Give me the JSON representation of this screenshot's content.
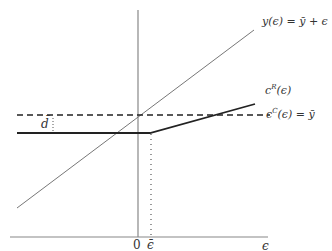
{
  "diagram": {
    "labels": {
      "income_line": "y(ϵ) = ȳ + ϵ",
      "risky_consumption": "c",
      "risky_consumption_sup": "R",
      "risky_consumption_arg": "(ϵ)",
      "constant_consumption": "c",
      "constant_consumption_sup": "C",
      "constant_consumption_rest": "(ϵ) = ȳ",
      "debt_level": "d̄",
      "debt_colon": ":",
      "origin": "0",
      "threshold": "ϵ̄",
      "x_axis": "ϵ"
    },
    "colors": {
      "axis": "#888888",
      "thin_line": "#777777",
      "thick_line": "#222222",
      "dashed_line": "#222222",
      "dotted_line": "#555555"
    }
  }
}
